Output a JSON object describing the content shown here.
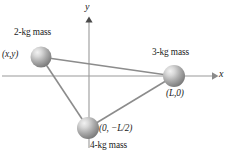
{
  "figure": {
    "type": "physics-diagram",
    "background_color": "#ffffff",
    "line_color": "#8c8c8c",
    "axis_color": "#999999",
    "sphere_color": "#9a9a9a",
    "text_color": "#1a1a1a"
  },
  "axes": {
    "x_label": "x",
    "y_label": "y",
    "origin": {
      "x": 89,
      "y": 76
    },
    "x_axis": {
      "x1": 2,
      "x2": 215,
      "y": 76,
      "arrow": "right"
    },
    "y_axis": {
      "y1": 19,
      "y2": 148,
      "x": 89,
      "arrow": "up"
    }
  },
  "masses": [
    {
      "id": "mass-2kg",
      "label": "2-kg mass",
      "coordinate": "(x,y)",
      "cx": 41,
      "cy": 57,
      "r": 10.5,
      "label_pos": {
        "x": 14,
        "y": 28
      },
      "coord_pos": {
        "x": 2,
        "y": 50
      }
    },
    {
      "id": "mass-3kg",
      "label": "3-kg mass",
      "coordinate": "(L,0)",
      "cx": 174,
      "cy": 76,
      "r": 11,
      "label_pos": {
        "x": 152,
        "y": 48
      },
      "coord_pos": {
        "x": 166,
        "y": 89
      }
    },
    {
      "id": "mass-4kg",
      "label": "4-kg mass",
      "coordinate": "(0, −L/2)",
      "cx": 88,
      "cy": 128,
      "r": 11,
      "label_pos": {
        "x": 90,
        "y": 142
      },
      "coord_pos": {
        "x": 99,
        "y": 128
      }
    }
  ],
  "edges": [
    {
      "from": "mass-2kg",
      "to": "mass-3kg"
    },
    {
      "from": "mass-2kg",
      "to": "mass-4kg"
    },
    {
      "from": "mass-4kg",
      "to": "mass-3kg"
    }
  ]
}
